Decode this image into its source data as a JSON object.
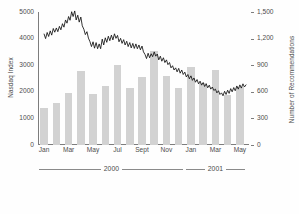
{
  "chart_data": {
    "type": "bar",
    "title": "",
    "subtitle": "",
    "xlabel": "",
    "ylabel": "Nasdaq Index",
    "y2label": "Number of Recommendations",
    "grid": false,
    "legend": null,
    "categories": [
      "Jan 2000",
      "Feb 2000",
      "Mar 2000",
      "Apr 2000",
      "May 2000",
      "Jun 2000",
      "Jul 2000",
      "Aug 2000",
      "Sept 2000",
      "Oct 2000",
      "Nov 2000",
      "Dec 2000",
      "Jan 2001",
      "Feb 2001",
      "Mar 2001",
      "Apr 2001",
      "May 2001"
    ],
    "x_tick_labels": [
      "Jan",
      "Mar",
      "May",
      "Jul",
      "Sept",
      "Nov",
      "Jan",
      "Mar",
      "May"
    ],
    "x_tick_indices": [
      0,
      2,
      4,
      6,
      8,
      10,
      12,
      14,
      16
    ],
    "ylim": [
      0,
      5000
    ],
    "y_ticks": [
      0,
      1000,
      2000,
      3000,
      4000,
      5000
    ],
    "y_tick_labels": [
      "0",
      "1000",
      "2000",
      "3000",
      "4000",
      "5000"
    ],
    "y2lim": [
      0,
      1500
    ],
    "y2_ticks": [
      0,
      300,
      600,
      900,
      1200,
      1500
    ],
    "y2_tick_labels": [
      "0",
      "300",
      "600",
      "900",
      "1,200",
      "1,500"
    ],
    "series": [
      {
        "name": "Number of Recommendations",
        "type": "bar",
        "axis": "y2",
        "color": "#d2d2d2",
        "values": [
          415,
          470,
          585,
          830,
          575,
          665,
          900,
          640,
          770,
          1060,
          775,
          645,
          885,
          700,
          845,
          560,
          650
        ]
      },
      {
        "name": "Nasdaq Index",
        "type": "line",
        "axis": "y1",
        "color": "#111111",
        "x": [
          0.0,
          0.12,
          0.25,
          0.37,
          0.5,
          0.62,
          0.75,
          0.87,
          1.0,
          1.12,
          1.25,
          1.37,
          1.5,
          1.62,
          1.75,
          1.87,
          2.0,
          2.12,
          2.25,
          2.37,
          2.5,
          2.62,
          2.75,
          2.87,
          3.0,
          3.12,
          3.25,
          3.37,
          3.5,
          3.62,
          3.75,
          3.87,
          4.0,
          4.12,
          4.25,
          4.37,
          4.5,
          4.62,
          4.75,
          4.87,
          5.0,
          5.12,
          5.25,
          5.37,
          5.5,
          5.62,
          5.75,
          5.87,
          6.0,
          6.12,
          6.25,
          6.37,
          6.5,
          6.62,
          6.75,
          6.87,
          7.0,
          7.12,
          7.25,
          7.37,
          7.5,
          7.62,
          7.75,
          7.87,
          8.0,
          8.12,
          8.25,
          8.37,
          8.5,
          8.62,
          8.75,
          8.87,
          9.0,
          9.12,
          9.25,
          9.37,
          9.5,
          9.62,
          9.75,
          9.87,
          10.0,
          10.12,
          10.25,
          10.37,
          10.5,
          10.62,
          10.75,
          10.87,
          11.0,
          11.12,
          11.25,
          11.37,
          11.5,
          11.62,
          11.75,
          11.87,
          12.0,
          12.12,
          12.25,
          12.37,
          12.5,
          12.62,
          12.75,
          12.87,
          13.0,
          13.12,
          13.25,
          13.37,
          13.5,
          13.62,
          13.75,
          13.87,
          14.0,
          14.12,
          14.25,
          14.37,
          14.5,
          14.62,
          14.75,
          14.87,
          15.0,
          15.12,
          15.25,
          15.37,
          15.5,
          15.62,
          15.75,
          15.87,
          16.0,
          16.12,
          16.25,
          16.37,
          16.5
        ],
        "values": [
          4170,
          4000,
          4230,
          4080,
          4290,
          4130,
          4380,
          4240,
          4400,
          4260,
          4460,
          4330,
          4560,
          4430,
          4700,
          4580,
          4830,
          4690,
          5010,
          4830,
          5040,
          4700,
          4880,
          4620,
          4810,
          4480,
          4350,
          4150,
          4260,
          4020,
          3880,
          3700,
          3880,
          3640,
          3850,
          3620,
          3800,
          3620,
          3980,
          3760,
          4030,
          3860,
          4090,
          3920,
          4130,
          3950,
          4180,
          4010,
          4120,
          3880,
          4010,
          3820,
          3960,
          3760,
          3900,
          3700,
          3850,
          3650,
          3820,
          3630,
          3800,
          3620,
          3760,
          3580,
          3720,
          3500,
          3400,
          3250,
          3450,
          3280,
          3430,
          3320,
          3500,
          3340,
          3420,
          3200,
          3340,
          3150,
          3280,
          3100,
          3200,
          3020,
          3100,
          2900,
          2980,
          2820,
          2900,
          2750,
          2880,
          2700,
          2820,
          2650,
          2740,
          2560,
          2650,
          2490,
          2600,
          2430,
          2520,
          2360,
          2460,
          2300,
          2400,
          2250,
          2350,
          2200,
          2300,
          2150,
          2250,
          2100,
          2180,
          2050,
          2100,
          1960,
          2040,
          1900,
          1960,
          1850,
          2020,
          1900,
          2060,
          1940,
          2120,
          2000,
          2160,
          2040,
          2220,
          2100,
          2260,
          2140,
          2300,
          2180,
          2260
        ]
      }
    ],
    "year_brackets": [
      {
        "label": "2000",
        "start_index": 0,
        "end_index": 11
      },
      {
        "label": "2001",
        "start_index": 12,
        "end_index": 16
      }
    ]
  }
}
